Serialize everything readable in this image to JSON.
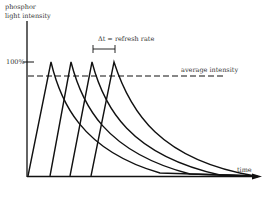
{
  "diagram": {
    "y_axis_label_line1": "phosphor",
    "y_axis_label_line2": "light intensity",
    "x_axis_label": "time",
    "tick_100": "100%",
    "average_label": "average intensity",
    "delta_label": "Δt = refresh rate",
    "stroke_color": "#111111",
    "pulses": [
      {
        "start_x": 28,
        "peak_x": 51
      },
      {
        "start_x": 50,
        "peak_x": 71
      },
      {
        "start_x": 70,
        "peak_x": 92
      },
      {
        "start_x": 91,
        "peak_x": 114
      }
    ]
  }
}
